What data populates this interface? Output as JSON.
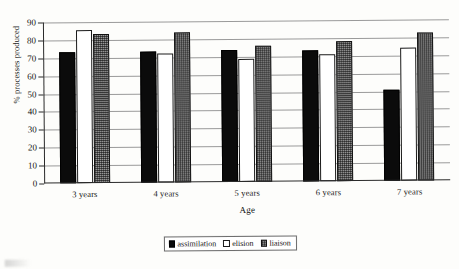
{
  "chart_data": {
    "type": "bar",
    "title": "",
    "xlabel": "Age",
    "ylabel": "% processes produced",
    "categories": [
      "3 years",
      "4 years",
      "5 years",
      "6 years",
      "7 years"
    ],
    "series": [
      {
        "name": "assimilation",
        "color": "#0b0b0b",
        "fill": "solid-black",
        "values": [
          73,
          73,
          74,
          73,
          51
        ]
      },
      {
        "name": "elision",
        "color": "#ffffff",
        "fill": "white-outline",
        "values": [
          85.5,
          72,
          69,
          71,
          74.5
        ]
      },
      {
        "name": "liaison",
        "color": "#9d9d9d",
        "fill": "gray-dotted",
        "values": [
          83.5,
          84,
          76,
          78.5,
          83
        ]
      }
    ],
    "ylim": [
      0,
      90
    ],
    "yticks": [
      0,
      10,
      20,
      30,
      40,
      50,
      60,
      70,
      80,
      90
    ],
    "ytick_labels": [
      "0",
      "10",
      "20",
      "30",
      "40",
      "50",
      "60",
      "70",
      "80",
      "90"
    ],
    "grid": true,
    "grid_axis": "y",
    "legend_position": "bottom",
    "legend_entries": [
      "assimilation",
      "elision",
      "liaison"
    ]
  },
  "axes": {
    "y_title": "% processes produced",
    "x_title": "Age"
  },
  "legend": {
    "items": [
      {
        "label": "assimilation"
      },
      {
        "label": "elision"
      },
      {
        "label": "liaison"
      }
    ]
  }
}
